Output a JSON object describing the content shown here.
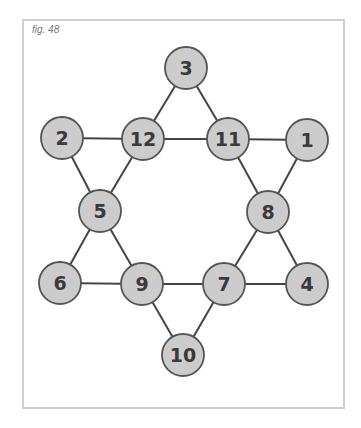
{
  "figure": {
    "caption": "fig. 48",
    "colors": {
      "node_fill": "#cccccc",
      "node_stroke": "#555555",
      "edge": "#444444",
      "frame": "#cfcfcf"
    },
    "nodes": [
      {
        "id": "n3",
        "label": "3",
        "x": 186,
        "y": 68
      },
      {
        "id": "n2",
        "label": "2",
        "x": 62,
        "y": 138
      },
      {
        "id": "n12",
        "label": "12",
        "x": 143,
        "y": 139
      },
      {
        "id": "n11",
        "label": "11",
        "x": 228,
        "y": 139
      },
      {
        "id": "n1",
        "label": "1",
        "x": 307,
        "y": 140
      },
      {
        "id": "n5",
        "label": "5",
        "x": 100,
        "y": 211
      },
      {
        "id": "n8",
        "label": "8",
        "x": 268,
        "y": 212
      },
      {
        "id": "n6",
        "label": "6",
        "x": 60,
        "y": 283
      },
      {
        "id": "n9",
        "label": "9",
        "x": 142,
        "y": 284
      },
      {
        "id": "n7",
        "label": "7",
        "x": 224,
        "y": 284
      },
      {
        "id": "n4",
        "label": "4",
        "x": 307,
        "y": 284
      },
      {
        "id": "n10",
        "label": "10",
        "x": 183,
        "y": 355
      }
    ],
    "edges": [
      [
        "3",
        "12"
      ],
      [
        "3",
        "11"
      ],
      [
        "2",
        "12"
      ],
      [
        "12",
        "11"
      ],
      [
        "11",
        "1"
      ],
      [
        "2",
        "5"
      ],
      [
        "12",
        "5"
      ],
      [
        "11",
        "8"
      ],
      [
        "1",
        "8"
      ],
      [
        "5",
        "6"
      ],
      [
        "5",
        "9"
      ],
      [
        "8",
        "7"
      ],
      [
        "8",
        "4"
      ],
      [
        "6",
        "9"
      ],
      [
        "9",
        "7"
      ],
      [
        "7",
        "4"
      ],
      [
        "9",
        "10"
      ],
      [
        "7",
        "10"
      ]
    ]
  }
}
